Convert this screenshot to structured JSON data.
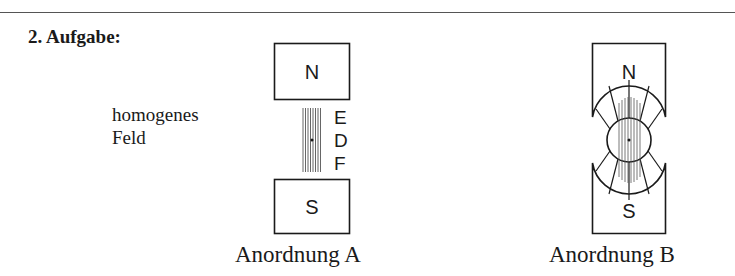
{
  "task": {
    "title": "2. Aufgabe:"
  },
  "field_label": {
    "line1": "homogenes",
    "line2": "Feld"
  },
  "arrangement_a": {
    "caption": "Anordnung A",
    "north_label": "N",
    "south_label": "S",
    "side_letters": [
      "E",
      "D",
      "F"
    ]
  },
  "arrangement_b": {
    "caption": "Anordnung B",
    "north_label": "N",
    "south_label": "S"
  },
  "colors": {
    "line": "#1a1a1a",
    "field_lines": "#555555"
  }
}
